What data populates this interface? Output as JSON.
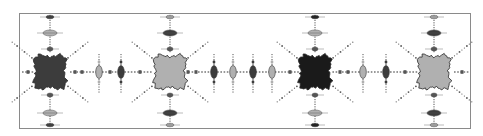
{
  "figure": {
    "colors": {
      "background": "#ffffff",
      "frame": "#8a8a8a",
      "dark": "#3c3c3c",
      "darkest": "#1a1a1a",
      "light": "#b0b0b0",
      "dot": "#555555"
    },
    "large_blobs": [
      {
        "name": "blob-1",
        "shade": "dark"
      },
      {
        "name": "blob-2",
        "shade": "light"
      },
      {
        "name": "blob-3",
        "shade": "darkest"
      },
      {
        "name": "blob-4",
        "shade": "light"
      }
    ],
    "small_blobs": [
      {
        "shade": "light"
      },
      {
        "shade": "dark"
      },
      {
        "shade": "dark"
      },
      {
        "shade": "light"
      },
      {
        "shade": "dark"
      },
      {
        "shade": "light"
      },
      {
        "shade": "light"
      },
      {
        "shade": "dark"
      }
    ]
  }
}
